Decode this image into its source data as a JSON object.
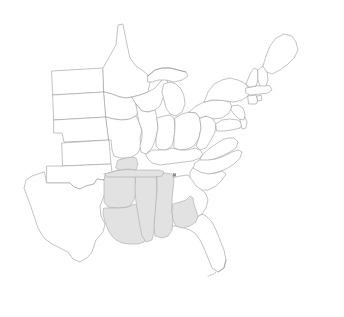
{
  "map": {
    "title": "United States Region Map",
    "projection_note": "Eastern and Central United States",
    "background_color": "#ffffff",
    "outline_color": "#9a9a9a",
    "highlight_fill_color": "#e2e2e2",
    "highlight_stroke_color": "#a8a8a8",
    "unhighlighted_fill_color": "#ffffff",
    "marker_color": "#8c8c8c",
    "width": 344,
    "height": 317,
    "legend": "",
    "labels_shown": "none",
    "highlighted_states": [
      "Arkansas",
      "Louisiana",
      "Mississippi",
      "Alabama",
      "Tennessee",
      "Georgia"
    ],
    "unhighlighted_states": [
      "Texas",
      "Oklahoma",
      "Kansas",
      "Nebraska",
      "South Dakota",
      "North Dakota",
      "Minnesota",
      "Iowa",
      "Missouri",
      "Wisconsin",
      "Illinois",
      "Michigan",
      "Indiana",
      "Ohio",
      "Kentucky",
      "West Virginia",
      "Virginia",
      "North Carolina",
      "South Carolina",
      "Florida",
      "Pennsylvania",
      "New York",
      "Maryland",
      "Delaware",
      "New Jersey",
      "Connecticut",
      "Rhode Island",
      "Massachusetts",
      "Vermont",
      "New Hampshire",
      "Maine"
    ],
    "markers": [
      {
        "name": "tennessee-marker",
        "x": 174.5,
        "y": 175.0,
        "size": 2.6
      }
    ]
  }
}
